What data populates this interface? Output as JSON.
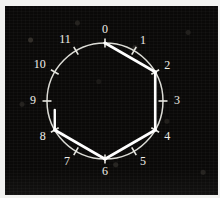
{
  "figure": {
    "background_color": "#0a0908",
    "ink_color": "#ffffff",
    "border_color": "#f2f2f0"
  },
  "chart_data": {
    "type": "scatter",
    "title": "",
    "xlabel": "",
    "ylabel": "",
    "geometry": {
      "center_x": 100,
      "center_y": 95,
      "radius": 58,
      "positions": 12,
      "start_angle_deg": -90,
      "direction": "clockwise"
    },
    "tick_labels": [
      "0",
      "1",
      "2",
      "3",
      "4",
      "5",
      "6",
      "7",
      "8",
      "9",
      "10",
      "11"
    ],
    "nodes": [
      {
        "label": "0",
        "index": 0,
        "angle_deg": -90,
        "marked": true,
        "label_dx": 0,
        "label_dy": -13
      },
      {
        "label": "1",
        "index": 1,
        "angle_deg": -60,
        "marked": false,
        "label_dx": 9,
        "label_dy": -10
      },
      {
        "label": "2",
        "index": 2,
        "angle_deg": -30,
        "marked": true,
        "label_dx": 12,
        "label_dy": -6
      },
      {
        "label": "3",
        "index": 3,
        "angle_deg": 0,
        "marked": false,
        "label_dx": 14,
        "label_dy": 0
      },
      {
        "label": "4",
        "index": 4,
        "angle_deg": 30,
        "marked": true,
        "label_dx": 12,
        "label_dy": 7
      },
      {
        "label": "5",
        "index": 5,
        "angle_deg": 60,
        "marked": false,
        "label_dx": 9,
        "label_dy": 11
      },
      {
        "label": "6",
        "index": 6,
        "angle_deg": 90,
        "marked": true,
        "label_dx": 0,
        "label_dy": 13
      },
      {
        "label": "7",
        "index": 7,
        "angle_deg": 120,
        "marked": false,
        "label_dx": -9,
        "label_dy": 11
      },
      {
        "label": "8",
        "index": 8,
        "angle_deg": 150,
        "marked": true,
        "label_dx": -12,
        "label_dy": 7
      },
      {
        "label": "9",
        "index": 9,
        "angle_deg": 180,
        "marked": false,
        "label_dx": -14,
        "label_dy": 0
      },
      {
        "label": "10",
        "index": 10,
        "angle_deg": 210,
        "marked": false,
        "label_dx": -15,
        "label_dy": -7
      },
      {
        "label": "11",
        "index": 11,
        "angle_deg": 240,
        "marked": false,
        "label_dx": -11,
        "label_dy": -11
      }
    ],
    "chords": [
      {
        "from": 0,
        "to": 2
      },
      {
        "from": 2,
        "to": 4
      },
      {
        "from": 4,
        "to": 6
      },
      {
        "from": 6,
        "to": 8
      }
    ],
    "stems": [
      {
        "at": 8,
        "length": 20,
        "direction_deg": -90
      }
    ],
    "legend": [],
    "annotations": []
  }
}
